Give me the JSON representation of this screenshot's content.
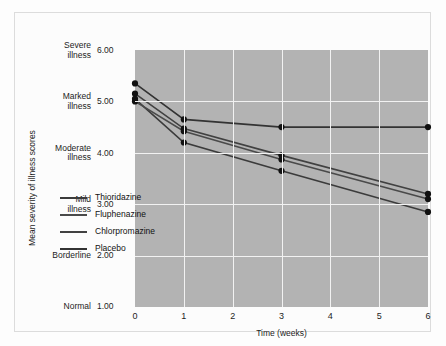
{
  "chart_data": {
    "type": "line",
    "title": "",
    "xlabel": "Time (weeks)",
    "ylabel": "Mean severity of illness scores",
    "x": [
      0,
      1,
      3,
      6
    ],
    "xlim": [
      0,
      6
    ],
    "ylim": [
      1.0,
      6.0
    ],
    "xticks": [
      "0",
      "1",
      "2",
      "3",
      "4",
      "5",
      "6"
    ],
    "yticks": [
      {
        "value": "6.00",
        "words_line1": "Severe",
        "words_line2": "illness"
      },
      {
        "value": "5.00",
        "words_line1": "Marked",
        "words_line2": "illness"
      },
      {
        "value": "4.00",
        "words_line1": "Moderate",
        "words_line2": "illness"
      },
      {
        "value": "3.00",
        "words_line1": "Mild",
        "words_line2": "illness"
      },
      {
        "value": "2.00",
        "words_line1": "Borderline",
        "words_line2": ""
      },
      {
        "value": "1.00",
        "words_line1": "Normal",
        "words_line2": ""
      }
    ],
    "grid": true,
    "legend_position": "inside-lower-left",
    "plot_background": "#b3b3b3",
    "grid_color": "#f2f2f2",
    "marker_color": "#111111",
    "series": [
      {
        "name": "Thioridazine",
        "color": "#3b3b3b",
        "values": [
          5.05,
          4.2,
          3.65,
          2.85
        ]
      },
      {
        "name": "Fluphenazine",
        "color": "#4a4a4a",
        "values": [
          5.0,
          4.42,
          3.87,
          3.1
        ]
      },
      {
        "name": "Chlorpromazine",
        "color": "#414141",
        "values": [
          5.15,
          4.47,
          3.95,
          3.2
        ]
      },
      {
        "name": "Placebo",
        "color": "#333333",
        "values": [
          5.35,
          4.65,
          4.5,
          4.5
        ]
      }
    ]
  }
}
